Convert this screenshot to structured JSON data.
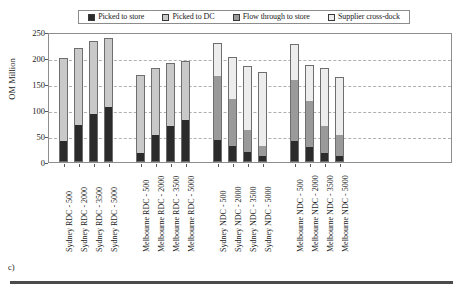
{
  "caption": "c)",
  "chart_data": {
    "type": "bar",
    "subtype": "stacked",
    "title": "",
    "xlabel": "",
    "ylabel": "OM Million",
    "ylim": [
      0,
      250
    ],
    "yticks": [
      0,
      50,
      100,
      150,
      200,
      250
    ],
    "grid": true,
    "legend_position": "top",
    "categories": [
      "Sydney RDC - 500",
      "Sydney RDC - 2000",
      "Sydney RDC - 3500",
      "Sydney RDC - 5000",
      "Melbourne RDC - 500",
      "Melbourne RDC - 2000",
      "Melbourne RDC - 3500",
      "Melbourne RDC - 5000",
      "Sydney NDC - 500",
      "Sydney NDC - 2000",
      "Sydney NDC - 3500",
      "Sydney NDC - 5000",
      "Melbourne NDC - 500",
      "Melbourne NDC - 2000",
      "Melbourne NDC - 3500",
      "Melbourne NDC - 5000"
    ],
    "series": [
      {
        "name": "Picked to store",
        "color": "#2b2b2b",
        "values": [
          40,
          72,
          92,
          105,
          18,
          52,
          70,
          80,
          42,
          30,
          20,
          12,
          40,
          28,
          18,
          12
        ]
      },
      {
        "name": "Picked to DC",
        "color": "#c9c9c9",
        "values": [
          160,
          148,
          140,
          133,
          150,
          128,
          120,
          115,
          0,
          0,
          0,
          0,
          0,
          0,
          0,
          0
        ]
      },
      {
        "name": "Flow through to store",
        "color": "#9a9a9a",
        "values": [
          0,
          0,
          0,
          0,
          0,
          0,
          0,
          0,
          123,
          92,
          42,
          18,
          118,
          90,
          52,
          40
        ]
      },
      {
        "name": "Supplier cross-dock",
        "color": "#ededed",
        "values": [
          0,
          0,
          0,
          0,
          0,
          0,
          0,
          0,
          63,
          80,
          122,
          143,
          68,
          68,
          110,
          112
        ]
      }
    ],
    "totals": [
      200,
      220,
      232,
      238,
      168,
      180,
      190,
      195,
      228,
      202,
      184,
      173,
      226,
      186,
      180,
      164
    ]
  }
}
